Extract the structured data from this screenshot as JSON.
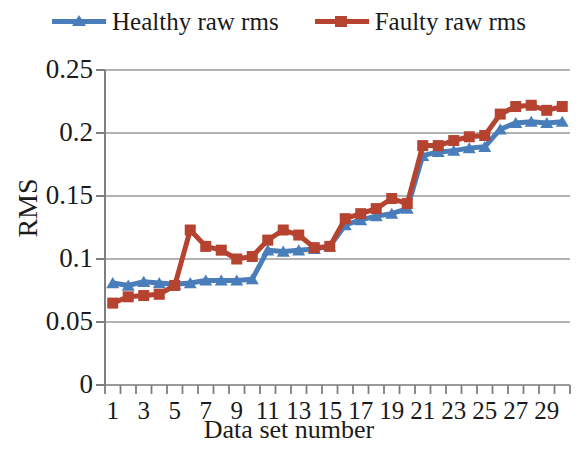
{
  "legend": {
    "position": "top-center",
    "entries": [
      {
        "label": "Healthy raw rms",
        "color": "#4a7ebb",
        "marker": "triangle",
        "icon": "legend-line-triangle-icon"
      },
      {
        "label": "Faulty raw rms",
        "color": "#b5432f",
        "marker": "square",
        "icon": "legend-line-square-icon"
      }
    ]
  },
  "axes": {
    "y_title": "RMS",
    "x_title": "Data set number",
    "y_ticks": [
      "0",
      "0.05",
      "0.1",
      "0.15",
      "0.2",
      "0.25"
    ],
    "x_ticks": [
      "1",
      "3",
      "5",
      "7",
      "9",
      "11",
      "13",
      "15",
      "17",
      "19",
      "21",
      "23",
      "25",
      "27",
      "29"
    ]
  },
  "colors": {
    "healthy": "#4a7ebb",
    "faulty": "#b5432f",
    "grid": "#9a9a9a",
    "axis": "#7f7f7f",
    "text": "#1a1a1a",
    "background": "#ffffff"
  },
  "chart_data": {
    "type": "line",
    "title": "",
    "xlabel": "Data set number",
    "ylabel": "RMS",
    "xlim": [
      1,
      30
    ],
    "ylim": [
      0,
      0.25
    ],
    "ytick_step": 0.05,
    "grid": true,
    "legend_position": "top-center",
    "markers": {
      "Healthy raw rms": "triangle",
      "Faulty raw rms": "square"
    },
    "x": [
      1,
      2,
      3,
      4,
      5,
      6,
      7,
      8,
      9,
      10,
      11,
      12,
      13,
      14,
      15,
      16,
      17,
      18,
      19,
      20,
      21,
      22,
      23,
      24,
      25,
      26,
      27,
      28,
      29,
      30
    ],
    "series": [
      {
        "name": "Healthy raw rms",
        "color": "#4a7ebb",
        "values": [
          0.081,
          0.079,
          0.082,
          0.081,
          0.08,
          0.081,
          0.083,
          0.083,
          0.083,
          0.084,
          0.107,
          0.106,
          0.107,
          0.108,
          0.11,
          0.127,
          0.131,
          0.134,
          0.136,
          0.14,
          0.182,
          0.185,
          0.186,
          0.188,
          0.189,
          0.203,
          0.208,
          0.209,
          0.208,
          0.209
        ]
      },
      {
        "name": "Faulty raw rms",
        "color": "#b5432f",
        "values": [
          0.065,
          0.07,
          0.071,
          0.072,
          0.079,
          0.123,
          0.11,
          0.107,
          0.1,
          0.102,
          0.115,
          0.123,
          0.119,
          0.109,
          0.11,
          0.132,
          0.136,
          0.14,
          0.148,
          0.144,
          0.19,
          0.19,
          0.194,
          0.197,
          0.198,
          0.215,
          0.221,
          0.222,
          0.218,
          0.221
        ]
      }
    ]
  }
}
